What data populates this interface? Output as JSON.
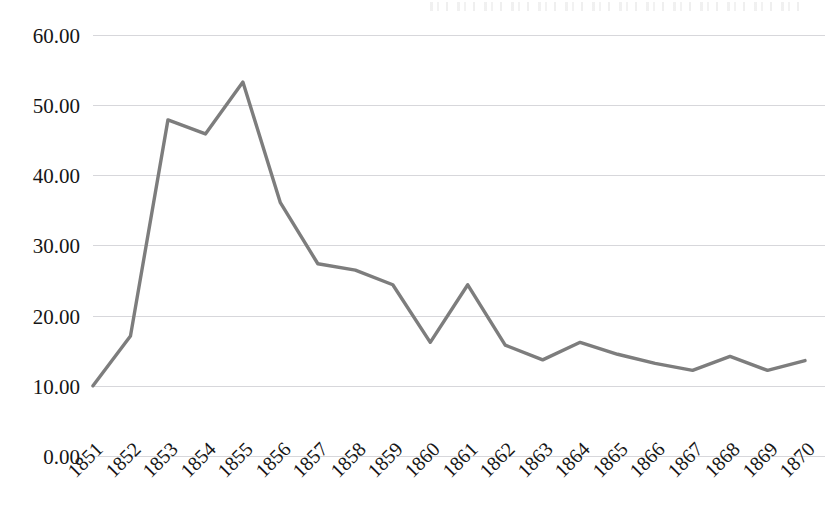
{
  "chart_data": {
    "type": "line",
    "title": "",
    "subtitle": "",
    "xlabel": "",
    "ylabel": "",
    "categories": [
      "1851",
      "1852",
      "1853",
      "1854",
      "1855",
      "1856",
      "1857",
      "1858",
      "1859",
      "1860",
      "1861",
      "1862",
      "1863",
      "1864",
      "1865",
      "1866",
      "1867",
      "1868",
      "1869",
      "1870"
    ],
    "values": [
      10.0,
      17.1,
      47.9,
      45.9,
      53.3,
      36.1,
      27.4,
      26.5,
      24.4,
      16.2,
      24.4,
      15.8,
      13.7,
      16.2,
      14.5,
      13.2,
      12.2,
      14.2,
      12.2,
      13.6
    ],
    "series": [
      {
        "name": "series-1",
        "values": [
          10.0,
          17.1,
          47.9,
          45.9,
          53.3,
          36.1,
          27.4,
          26.5,
          24.4,
          16.2,
          24.4,
          15.8,
          13.7,
          16.2,
          14.5,
          13.2,
          12.2,
          14.2,
          12.2,
          13.6
        ]
      }
    ],
    "ylim": [
      0,
      60
    ],
    "ytick_values": [
      0,
      10,
      20,
      30,
      40,
      50,
      60
    ],
    "ytick_labels": [
      "0.00",
      "10.00",
      "20.00",
      "30.00",
      "40.00",
      "50.00",
      "60.00"
    ],
    "xtick_labels": [
      "1851",
      "1852",
      "1853",
      "1854",
      "1855",
      "1856",
      "1857",
      "1858",
      "1859",
      "1860",
      "1861",
      "1862",
      "1863",
      "1864",
      "1865",
      "1866",
      "1867",
      "1868",
      "1869",
      "1870"
    ],
    "xtick_rotation_degrees": -45,
    "grid": true,
    "grid_axis": "y",
    "legend": false,
    "legend_position": "none",
    "markers": false,
    "line_color": "#7d7d7d",
    "grid_color": "#c9c9cf",
    "text_color": "#161616",
    "background_color": "#ffffff"
  }
}
